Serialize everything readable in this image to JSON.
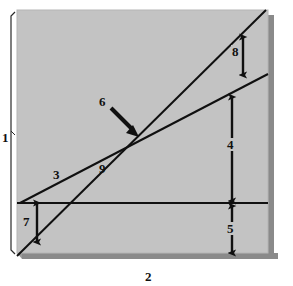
{
  "figure": {
    "type": "line-diagram",
    "title": "",
    "background_color": "#ffffff",
    "panel_color": "#c3c3c3",
    "panel_shadow_color": "#8a8a8a",
    "line_color": "#101010",
    "label_color": "#101010"
  },
  "panel": {
    "x": 17,
    "y": 10,
    "width": 256,
    "height": 248
  },
  "axes": {
    "vertical": {
      "label": "1",
      "bracket": true,
      "label_x": 2,
      "label_y": 131
    },
    "horizontal": {
      "label": "2",
      "label_x": 145,
      "label_y": 270
    }
  },
  "lines": [
    {
      "name": "shallow-line",
      "label": "3",
      "label_x": 53,
      "label_y": 174,
      "x1": 20,
      "y1": 203,
      "x2": 273,
      "y2": 72
    },
    {
      "name": "steep-line",
      "label": "9",
      "label_x": 99,
      "label_y": 168,
      "x1": 17,
      "y1": 258,
      "x2": 266,
      "y2": 10
    },
    {
      "name": "horizontal-reference-line",
      "label": "",
      "x1": 17,
      "y1": 203,
      "x2": 273,
      "y2": 203
    }
  ],
  "callout": {
    "name": "intersection-callout",
    "label": "6",
    "label_x": 99,
    "label_y": 101,
    "arrow_from": {
      "x": 112,
      "y": 109
    },
    "arrow_to": {
      "x": 137,
      "y": 134
    },
    "points_to": "intersection-of-lines-3-and-9"
  },
  "measures": [
    {
      "name": "measure-8",
      "label": "8",
      "label_x": 234,
      "label_y": 51,
      "x": 243,
      "y_top": 35,
      "y_bottom": 76,
      "from": "steep-line",
      "to": "shallow-line"
    },
    {
      "name": "measure-4",
      "label": "4",
      "label_x": 226,
      "label_y": 144,
      "x": 232,
      "y_top": 95,
      "y_bottom": 203,
      "from": "shallow-line",
      "to": "horizontal-reference-line"
    },
    {
      "name": "measure-5",
      "label": "5",
      "label_x": 226,
      "label_y": 230,
      "x": 232,
      "y_top": 203,
      "y_bottom": 256,
      "from": "horizontal-reference-line",
      "to": "panel-bottom"
    },
    {
      "name": "measure-7",
      "label": "7",
      "label_x": 22,
      "label_y": 222,
      "x": 37,
      "y_top": 203,
      "y_bottom": 243,
      "from": "horizontal-reference-line",
      "to": "steep-line"
    }
  ]
}
